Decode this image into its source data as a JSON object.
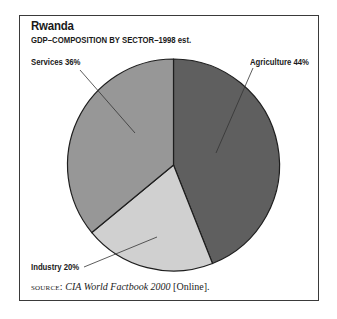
{
  "header": {
    "title": "Rwanda",
    "subtitle": "GDP–COMPOSITION BY SECTOR–1998 est."
  },
  "source": {
    "prefix": "source:",
    "title": "CIA World Factbook 2000",
    "suffix": "[Online]."
  },
  "labels": {
    "agriculture": "Agriculture 44%",
    "services": "Services 36%",
    "industry": "Industry 20%"
  },
  "colors": {
    "agriculture": "#5f5f5f",
    "industry": "#d0d0d0",
    "services": "#979797",
    "outline": "#1e1e1e"
  },
  "chart_data": {
    "type": "pie",
    "title": "Rwanda",
    "subtitle": "GDP–COMPOSITION BY SECTOR–1998 est.",
    "categories": [
      "Agriculture",
      "Industry",
      "Services"
    ],
    "values": [
      44,
      20,
      36
    ],
    "unit": "%",
    "start_angle": "12 o'clock, clockwise",
    "legend": "none (direct labels with leader lines)",
    "source": "SOURCE: CIA World Factbook 2000 [Online]."
  }
}
